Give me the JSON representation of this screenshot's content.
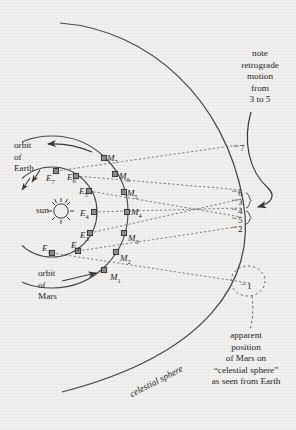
{
  "figure": {
    "background_color": "#f3f1ef",
    "ink_color": "#3a3a3a",
    "width": 296,
    "height": 430
  },
  "labels": {
    "sun": "sun",
    "orbit_of_earth": "orbit\nof\nEarth",
    "orbit_of_mars": "orbit\nof\nMars",
    "celestial_sphere": "celestial sphere",
    "note_retrograde": "note\nretrograde\nmotion\nfrom\n3 to 5",
    "apparent_position": "apparent\nposition\nof Mars on\n“celestial sphere”\nas seen from Earth"
  },
  "earth_positions": [
    {
      "id": "E1",
      "label": "E",
      "sub": "1",
      "x": 52,
      "y": 253,
      "lx": 42,
      "ly": 243
    },
    {
      "id": "E2",
      "label": "E",
      "sub": "2",
      "x": 78,
      "y": 251,
      "lx": 71,
      "ly": 240
    },
    {
      "id": "E3",
      "label": "E",
      "sub": "3",
      "x": 90,
      "y": 233,
      "lx": 80,
      "ly": 230
    },
    {
      "id": "E4",
      "label": "E",
      "sub": "4",
      "x": 94,
      "y": 212,
      "lx": 80,
      "ly": 208
    },
    {
      "id": "E5",
      "label": "E",
      "sub": "5",
      "x": 89,
      "y": 191,
      "lx": 79,
      "ly": 186
    },
    {
      "id": "E6",
      "label": "E",
      "sub": "6",
      "x": 76,
      "y": 176,
      "lx": 67,
      "ly": 172
    },
    {
      "id": "E7",
      "label": "E",
      "sub": "7",
      "x": 56,
      "y": 171,
      "lx": 46,
      "ly": 173
    }
  ],
  "mars_positions": [
    {
      "id": "M1",
      "label": "M",
      "sub": "1",
      "x": 104,
      "y": 270,
      "lx": 110,
      "ly": 272
    },
    {
      "id": "M2",
      "label": "M",
      "sub": "2",
      "x": 116,
      "y": 252,
      "lx": 120,
      "ly": 253
    },
    {
      "id": "M3",
      "label": "M",
      "sub": "3",
      "x": 124,
      "y": 233,
      "lx": 128,
      "ly": 233
    },
    {
      "id": "M4",
      "label": "M",
      "sub": "4",
      "x": 127,
      "y": 212,
      "lx": 131,
      "ly": 207
    },
    {
      "id": "M5",
      "label": "M",
      "sub": "5",
      "x": 124,
      "y": 192,
      "lx": 127,
      "ly": 188
    },
    {
      "id": "M6",
      "label": "M",
      "sub": "6",
      "x": 115,
      "y": 174,
      "lx": 119,
      "ly": 171
    },
    {
      "id": "M7",
      "label": "M",
      "sub": "7",
      "x": 104,
      "y": 158,
      "lx": 107,
      "ly": 153
    }
  ],
  "sphere_marks": [
    {
      "n": "7",
      "x": 240,
      "y": 143
    },
    {
      "n": "6",
      "x": 238,
      "y": 188
    },
    {
      "n": "3",
      "x": 238,
      "y": 197
    },
    {
      "n": "4",
      "x": 238,
      "y": 206
    },
    {
      "n": "5",
      "x": 238,
      "y": 215
    },
    {
      "n": "2",
      "x": 238,
      "y": 224
    },
    {
      "n": "1",
      "x": 247,
      "y": 281
    }
  ]
}
